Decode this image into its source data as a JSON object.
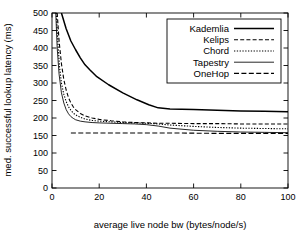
{
  "chart_data": {
    "type": "line",
    "title": "",
    "xlabel": "average live node bw (bytes/node/s)",
    "ylabel": "med. successful lookup latency (ms)",
    "xlim": [
      0,
      100
    ],
    "ylim": [
      0,
      500
    ],
    "xticks": [
      0,
      20,
      40,
      60,
      80,
      100
    ],
    "yticks": [
      0,
      50,
      100,
      150,
      200,
      250,
      300,
      350,
      400,
      450,
      500
    ],
    "grid": false,
    "legend_position": "upper right",
    "legend_entries": [
      "Kademlia",
      "Kelips",
      "Chord",
      "Tapestry",
      "OneHop"
    ],
    "series": [
      {
        "name": "Kademlia",
        "style": "solid",
        "points": [
          [
            4.0,
            500
          ],
          [
            6.0,
            455
          ],
          [
            8.0,
            420
          ],
          [
            10.0,
            395
          ],
          [
            12.0,
            372
          ],
          [
            14.0,
            352
          ],
          [
            16.0,
            338
          ],
          [
            19.0,
            318
          ],
          [
            24.0,
            295
          ],
          [
            30.0,
            272
          ],
          [
            36.0,
            252
          ],
          [
            41.0,
            238
          ],
          [
            45.0,
            229
          ],
          [
            50.0,
            226
          ],
          [
            60.0,
            224
          ],
          [
            70.0,
            222
          ],
          [
            80.0,
            220
          ],
          [
            90.0,
            219
          ],
          [
            100.0,
            218
          ]
        ]
      },
      {
        "name": "Kelips",
        "style": "dashed",
        "points": [
          [
            2.2,
            500
          ],
          [
            3.0,
            420
          ],
          [
            4.0,
            355
          ],
          [
            5.0,
            310
          ],
          [
            6.0,
            280
          ],
          [
            7.0,
            258
          ],
          [
            8.0,
            243
          ],
          [
            9.0,
            232
          ],
          [
            10.0,
            224
          ],
          [
            12.0,
            213
          ],
          [
            14.0,
            206
          ],
          [
            17.0,
            200
          ],
          [
            20.0,
            196
          ],
          [
            25.0,
            192
          ],
          [
            30.0,
            189
          ],
          [
            35.0,
            187
          ],
          [
            40.0,
            186
          ],
          [
            45.0,
            185
          ],
          [
            50.0,
            185
          ],
          [
            60.0,
            184
          ],
          [
            70.0,
            184
          ],
          [
            80.0,
            183
          ],
          [
            90.0,
            183
          ],
          [
            100.0,
            183
          ]
        ]
      },
      {
        "name": "Chord",
        "style": "dotted",
        "points": [
          [
            1.8,
            500
          ],
          [
            2.5,
            415
          ],
          [
            3.2,
            345
          ],
          [
            4.0,
            300
          ],
          [
            5.0,
            268
          ],
          [
            6.0,
            247
          ],
          [
            7.0,
            232
          ],
          [
            8.0,
            222
          ],
          [
            9.0,
            214
          ],
          [
            10.0,
            209
          ],
          [
            12.0,
            202
          ],
          [
            14.0,
            197
          ],
          [
            17.0,
            193
          ],
          [
            20.0,
            191
          ],
          [
            25.0,
            189
          ],
          [
            30.0,
            187
          ],
          [
            35.0,
            186
          ],
          [
            40.0,
            185
          ],
          [
            45.0,
            183
          ],
          [
            50.0,
            180
          ],
          [
            60.0,
            176
          ],
          [
            70.0,
            173
          ],
          [
            80.0,
            171
          ],
          [
            90.0,
            170
          ],
          [
            100.0,
            169
          ]
        ]
      },
      {
        "name": "Tapestry",
        "style": "thin-solid",
        "points": [
          [
            1.6,
            500
          ],
          [
            2.2,
            400
          ],
          [
            3.0,
            325
          ],
          [
            4.0,
            272
          ],
          [
            5.0,
            243
          ],
          [
            6.0,
            224
          ],
          [
            7.0,
            212
          ],
          [
            8.0,
            204
          ],
          [
            9.0,
            199
          ],
          [
            10.0,
            195
          ],
          [
            12.0,
            191
          ],
          [
            14.0,
            189
          ],
          [
            17.0,
            187
          ],
          [
            20.0,
            186
          ],
          [
            25.0,
            185
          ],
          [
            30.0,
            184
          ],
          [
            35.0,
            183
          ],
          [
            40.0,
            181
          ],
          [
            45.0,
            177
          ],
          [
            50.0,
            171
          ],
          [
            60.0,
            165
          ],
          [
            70.0,
            162
          ],
          [
            80.0,
            160
          ],
          [
            90.0,
            159
          ],
          [
            100.0,
            158
          ]
        ]
      },
      {
        "name": "OneHop",
        "style": "dash-dot",
        "points": [
          [
            8.0,
            157
          ],
          [
            15.0,
            157
          ],
          [
            25.0,
            157
          ],
          [
            40.0,
            157
          ],
          [
            55.0,
            157
          ],
          [
            70.0,
            156
          ],
          [
            85.0,
            156
          ],
          [
            100.0,
            156
          ]
        ]
      }
    ]
  }
}
